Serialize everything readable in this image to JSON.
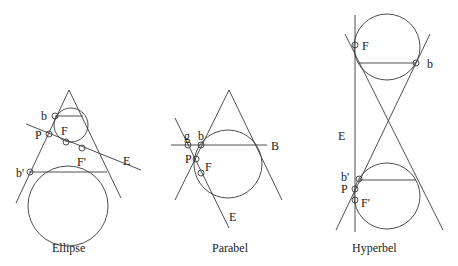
{
  "figures": [
    {
      "id": "ellipse",
      "caption": "Ellipse",
      "labels": {
        "b": "b",
        "P": "P",
        "F": "F",
        "F_prime": "F'",
        "E": "E",
        "b_prime": "b'"
      }
    },
    {
      "id": "parabel",
      "caption": "Parabel",
      "labels": {
        "g": "g",
        "b": "b",
        "P": "P",
        "F": "F",
        "B": "B",
        "E": "E"
      }
    },
    {
      "id": "hyperbel",
      "caption": "Hyperbel",
      "labels": {
        "F": "F",
        "b": "b",
        "E": "E",
        "b_prime": "b'",
        "P": "P",
        "F_prime": "F'"
      }
    }
  ],
  "colors": {
    "stroke": "#3a3a3a",
    "text": "#222222",
    "background": "#ffffff"
  }
}
